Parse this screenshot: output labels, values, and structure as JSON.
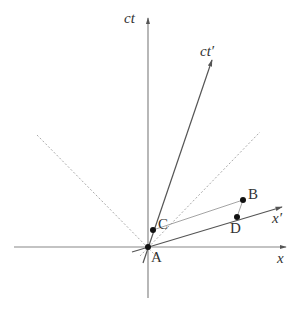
{
  "diagram": {
    "type": "spacetime-minkowski",
    "colors": {
      "axis": "#888888",
      "primed_axis": "#555555",
      "light_cone": "#aaaaaa",
      "point": "#111111",
      "label": "#333333"
    },
    "axes": {
      "ct": {
        "label": "ct"
      },
      "x": {
        "label": "x"
      },
      "ct_prime": {
        "label": "ct′"
      },
      "x_prime": {
        "label": "x′"
      }
    },
    "points": [
      {
        "id": "A",
        "label": "A"
      },
      {
        "id": "B",
        "label": "B"
      },
      {
        "id": "C",
        "label": "C"
      },
      {
        "id": "D",
        "label": "D"
      }
    ],
    "light_cone": {
      "style": "dotted",
      "lines": [
        "left 45°",
        "right 45°"
      ]
    },
    "connecting_lines": [
      {
        "from": "C",
        "to": "B",
        "style": "thin"
      },
      {
        "from": "D",
        "to": "B",
        "style": "thin"
      }
    ]
  }
}
